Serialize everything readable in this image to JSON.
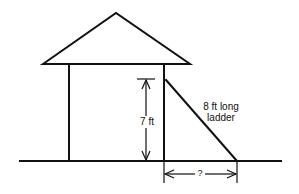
{
  "diagram": {
    "labels": {
      "height": "7 ft",
      "ladder_line1": "8 ft long",
      "ladder_line2": "ladder",
      "unknown": "?"
    },
    "colors": {
      "stroke": "#111111",
      "background": "#ffffff"
    }
  }
}
